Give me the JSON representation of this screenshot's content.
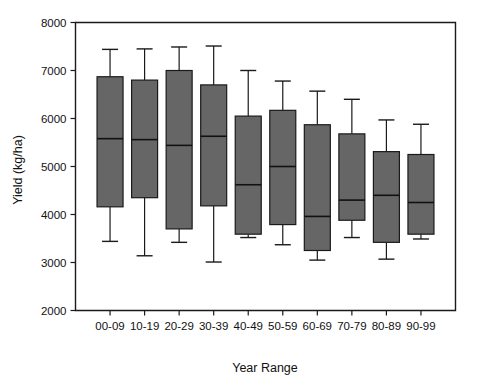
{
  "chart_data": {
    "type": "box",
    "title": "",
    "xlabel": "Year Range",
    "ylabel": "Yield (kg/ha)",
    "categories": [
      "00-09",
      "10-19",
      "20-29",
      "30-39",
      "40-49",
      "50-59",
      "60-69",
      "70-79",
      "80-89",
      "90-99"
    ],
    "ylim": [
      2000,
      8000
    ],
    "yticks": [
      2000,
      3000,
      4000,
      5000,
      6000,
      7000,
      8000
    ],
    "ytick_labels": [
      "2000",
      "3000",
      "4000",
      "5000",
      "6000",
      "7000",
      "8000"
    ],
    "grid": false,
    "legend": "none",
    "box_fill_color": "#666666",
    "box_edge_color": "#1a1a1a",
    "boxes": [
      {
        "category": "00-09",
        "whisker_low": 3440,
        "q1": 4160,
        "median": 5580,
        "q3": 6870,
        "whisker_high": 7440
      },
      {
        "category": "10-19",
        "whisker_low": 3140,
        "q1": 4350,
        "median": 5560,
        "q3": 6800,
        "whisker_high": 7450
      },
      {
        "category": "20-29",
        "whisker_low": 3420,
        "q1": 3700,
        "median": 5440,
        "q3": 7000,
        "whisker_high": 7490
      },
      {
        "category": "30-39",
        "whisker_low": 3010,
        "q1": 4180,
        "median": 5630,
        "q3": 6700,
        "whisker_high": 7510
      },
      {
        "category": "40-49",
        "whisker_low": 3520,
        "q1": 3590,
        "median": 4620,
        "q3": 6050,
        "whisker_high": 7000
      },
      {
        "category": "50-59",
        "whisker_low": 3370,
        "q1": 3790,
        "median": 5000,
        "q3": 6170,
        "whisker_high": 6780
      },
      {
        "category": "60-69",
        "whisker_low": 3050,
        "q1": 3250,
        "median": 3960,
        "q3": 5870,
        "whisker_high": 6570
      },
      {
        "category": "70-79",
        "whisker_low": 3520,
        "q1": 3880,
        "median": 4300,
        "q3": 5680,
        "whisker_high": 6400
      },
      {
        "category": "80-89",
        "whisker_low": 3070,
        "q1": 3420,
        "median": 4400,
        "q3": 5310,
        "whisker_high": 5970
      },
      {
        "category": "90-99",
        "whisker_low": 3490,
        "q1": 3590,
        "median": 4250,
        "q3": 5250,
        "whisker_high": 5880
      }
    ]
  }
}
